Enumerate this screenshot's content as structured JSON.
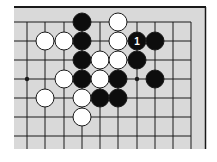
{
  "diagram": {
    "type": "go-board-fragment",
    "colors": {
      "board": "#d9d9d9",
      "line": "#1a1a1a",
      "black_stone": "#0d0d0d",
      "white_stone": "#ffffff",
      "stone_outline": "#1a1a1a",
      "label_on_black": "#ffffff"
    },
    "grid": {
      "columns_x": [
        27,
        45,
        64,
        82,
        100,
        118,
        137,
        155,
        173,
        191
      ],
      "rows_y": [
        22,
        41,
        60,
        79,
        98,
        117,
        136
      ],
      "top_edge": true,
      "right_edge": true
    },
    "star_points": [
      {
        "col": 0,
        "row": 3
      },
      {
        "col": 6,
        "row": 3
      }
    ],
    "stones": [
      {
        "color": "black",
        "col": 3,
        "row": 0
      },
      {
        "color": "white",
        "col": 5,
        "row": 0
      },
      {
        "color": "white",
        "col": 1,
        "row": 1
      },
      {
        "color": "white",
        "col": 2,
        "row": 1
      },
      {
        "color": "black",
        "col": 3,
        "row": 1
      },
      {
        "color": "white",
        "col": 5,
        "row": 1
      },
      {
        "color": "black",
        "col": 6,
        "row": 1,
        "label": "1"
      },
      {
        "color": "black",
        "col": 7,
        "row": 1
      },
      {
        "color": "black",
        "col": 3,
        "row": 2
      },
      {
        "color": "white",
        "col": 4,
        "row": 2
      },
      {
        "color": "white",
        "col": 5,
        "row": 2
      },
      {
        "color": "black",
        "col": 6,
        "row": 2
      },
      {
        "color": "white",
        "col": 2,
        "row": 3
      },
      {
        "color": "black",
        "col": 3,
        "row": 3
      },
      {
        "color": "white",
        "col": 4,
        "row": 3
      },
      {
        "color": "black",
        "col": 5,
        "row": 3
      },
      {
        "color": "black",
        "col": 7,
        "row": 3
      },
      {
        "color": "white",
        "col": 1,
        "row": 4
      },
      {
        "color": "white",
        "col": 3,
        "row": 4
      },
      {
        "color": "black",
        "col": 4,
        "row": 4
      },
      {
        "color": "black",
        "col": 5,
        "row": 4
      },
      {
        "color": "white",
        "col": 3,
        "row": 5
      }
    ]
  }
}
